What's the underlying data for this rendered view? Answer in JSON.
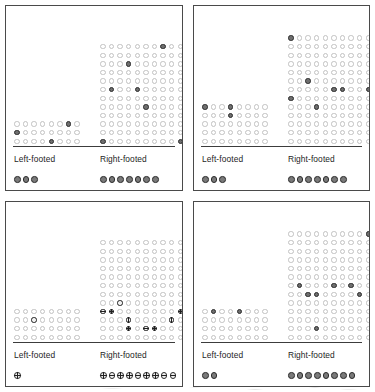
{
  "figure": {
    "layout": "2x2 panel grid",
    "panel_count": 4
  },
  "axis": {
    "left_label": "Left-footed",
    "right_label": "Right-footed"
  },
  "colors": {
    "open_circle": "#c2c2c2",
    "marked_circle_fill": "#6e6e6e",
    "marked_circle_stroke": "#2a2a2a",
    "baseline": "#3c3c3c",
    "panel_border": "#4a4a4a",
    "background": "#ffffff"
  },
  "chart_data": {
    "type": "scatter",
    "title": "",
    "xlabel": "",
    "ylabel": "",
    "categories": [
      "Left-footed",
      "Right-footed"
    ],
    "panels": [
      {
        "index": 1,
        "marker_style": "filled-circle",
        "groups": [
          {
            "name": "Left-footed",
            "columns": 8,
            "rows": 3,
            "total_circles": 24,
            "marked_cells": [
              [
                0,
                6
              ],
              [
                1,
                0
              ],
              [
                2,
                4
              ]
            ],
            "marked_count": 3,
            "summary_dots": 3
          },
          {
            "name": "Right-footed",
            "columns": 10,
            "rows": 12,
            "total_circles": 120,
            "marked_cells": [
              [
                0,
                7
              ],
              [
                2,
                3
              ],
              [
                5,
                1
              ],
              [
                5,
                4
              ],
              [
                7,
                5
              ],
              [
                11,
                0
              ],
              [
                11,
                9
              ]
            ],
            "marked_count": 7,
            "summary_dots": 7
          }
        ]
      },
      {
        "index": 2,
        "marker_style": "filled-circle",
        "groups": [
          {
            "name": "Left-footed",
            "columns": 8,
            "rows": 5,
            "total_circles": 40,
            "marked_cells": [
              [
                0,
                0
              ],
              [
                0,
                3
              ],
              [
                1,
                3
              ]
            ],
            "marked_count": 3,
            "summary_dots": 3
          },
          {
            "name": "Right-footed",
            "columns": 10,
            "rows": 13,
            "total_circles": 130,
            "marked_cells": [
              [
                0,
                0
              ],
              [
                5,
                2
              ],
              [
                6,
                5
              ],
              [
                6,
                6
              ],
              [
                6,
                9
              ],
              [
                7,
                0
              ],
              [
                8,
                3
              ]
            ],
            "marked_count": 7,
            "summary_dots": 7
          }
        ]
      },
      {
        "index": 3,
        "marker_style": "crosshair-circle",
        "groups": [
          {
            "name": "Left-footed",
            "columns": 8,
            "rows": 4,
            "total_circles": 32,
            "marked_cells": [
              [
                1,
                2
              ]
            ],
            "marked_count": 1,
            "summary_dots": 1
          },
          {
            "name": "Right-footed",
            "columns": 10,
            "rows": 12,
            "total_circles": 120,
            "marked_cells": [
              [
                7,
                2
              ],
              [
                8,
                0
              ],
              [
                8,
                1
              ],
              [
                8,
                9
              ],
              [
                9,
                3
              ],
              [
                9,
                8
              ],
              [
                10,
                3
              ],
              [
                10,
                5
              ],
              [
                10,
                6
              ]
            ],
            "marked_count": 9,
            "summary_dots": 9
          }
        ]
      },
      {
        "index": 4,
        "marker_style": "filled-circle",
        "groups": [
          {
            "name": "Left-footed",
            "columns": 8,
            "rows": 4,
            "total_circles": 32,
            "marked_cells": [
              [
                0,
                1
              ],
              [
                0,
                4
              ]
            ],
            "marked_count": 2,
            "summary_dots": 2
          },
          {
            "name": "Right-footed",
            "columns": 10,
            "rows": 13,
            "total_circles": 130,
            "marked_cells": [
              [
                0,
                9
              ],
              [
                6,
                1
              ],
              [
                6,
                5
              ],
              [
                6,
                7
              ],
              [
                7,
                2
              ],
              [
                7,
                3
              ],
              [
                7,
                8
              ],
              [
                11,
                3
              ]
            ],
            "marked_count": 8,
            "summary_dots": 8
          }
        ]
      }
    ]
  }
}
